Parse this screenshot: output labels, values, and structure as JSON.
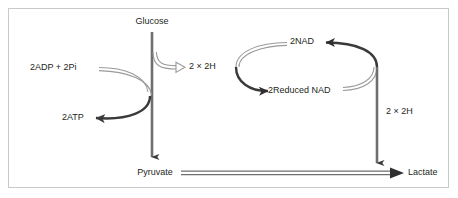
{
  "figure": {
    "background_color": "#ffffff",
    "border_color": "#c9c9c9",
    "line_color": "#3a3a3a",
    "hollow_line_color": "#8d8d8d",
    "text_color": "#231f20"
  },
  "labels": {
    "glucose": "Glucose",
    "pyruvate": "Pyruvate",
    "lactate": "Lactate",
    "adp_pi": "2ADP + 2Pi",
    "atp": "2ATP",
    "hydrogen_top": "2 × 2H",
    "hydrogen_right": "2 × 2H",
    "nad": "2NAD",
    "reduced_nad": "2Reduced NAD"
  },
  "pathway": {
    "nodes": [
      "Glucose",
      "Pyruvate",
      "Lactate",
      "2ADP + 2Pi",
      "2ATP",
      "2NAD",
      "2Reduced NAD"
    ],
    "arrows": [
      {
        "name": "glucose-to-pyruvate",
        "from": "Glucose",
        "to": "Pyruvate",
        "style": "solid",
        "direction": "down"
      },
      {
        "name": "pyruvate-to-lactate",
        "from": "Pyruvate",
        "to": "Lactate",
        "style": "hollow",
        "direction": "right"
      },
      {
        "name": "adp-to-atp",
        "from": "2ADP + 2Pi",
        "to": "2ATP",
        "style": "curve",
        "direction": "left"
      },
      {
        "name": "glucose-hydrogen-release",
        "from": "Glucose",
        "to": "2 × 2H",
        "style": "hollow",
        "direction": "right"
      },
      {
        "name": "nad-to-reduced-nad",
        "from": "2NAD",
        "to": "2Reduced NAD",
        "style": "curve",
        "direction": "down-left"
      },
      {
        "name": "reduced-nad-to-nad",
        "from": "2Reduced NAD",
        "to": "2NAD",
        "style": "curve",
        "direction": "up-right"
      },
      {
        "name": "hydrogen-to-lactate",
        "from": "2 × 2H",
        "to": "Lactate",
        "style": "solid",
        "direction": "down"
      }
    ]
  }
}
